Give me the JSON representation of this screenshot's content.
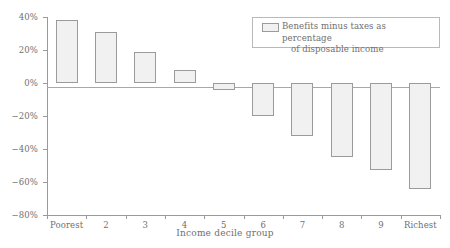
{
  "chart_data": {
    "type": "bar",
    "title": "",
    "xlabel": "Income decile group",
    "ylabel": "",
    "categories": [
      "Poorest",
      "2",
      "3",
      "4",
      "5",
      "6",
      "7",
      "8",
      "9",
      "Richest"
    ],
    "values": [
      38,
      31,
      19,
      8,
      -4,
      -20,
      -32,
      -45,
      -53,
      -64
    ],
    "series": [
      {
        "name": "Benefits minus taxes as percentage of disposable income",
        "values": [
          38,
          31,
          19,
          8,
          -4,
          -20,
          -32,
          -45,
          -53,
          -64
        ]
      }
    ],
    "ylim": [
      -80,
      40
    ],
    "yticks": [
      40,
      20,
      0,
      -20,
      -40,
      -60,
      -80
    ],
    "ytick_labels": [
      "40%",
      "20%",
      "0%",
      "−20%",
      "−40%",
      "−60%",
      "−80%"
    ],
    "grid": false,
    "legend_position": "top-right",
    "legend": {
      "line1": "Benefits minus taxes as percentage",
      "line2": "of disposable income"
    },
    "colors": {
      "bar_fill": "#f1f1f1",
      "bar_edge": "#9b9b9b",
      "axis": "#9a9a9a",
      "text": "#6f6f6f"
    }
  }
}
